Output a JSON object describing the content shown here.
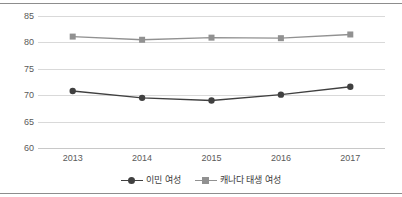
{
  "chart_data": {
    "type": "line",
    "title": "",
    "subtitle": "",
    "xlabel": "",
    "ylabel": "",
    "categories": [
      "2013",
      "2014",
      "2015",
      "2016",
      "2017"
    ],
    "ylim": [
      60,
      85
    ],
    "yticks": [
      60,
      65,
      70,
      75,
      80,
      85
    ],
    "ytick_labels": [
      "60",
      "65",
      "70",
      "75",
      "80",
      "85"
    ],
    "grid": true,
    "legend_position": "bottom",
    "series": [
      {
        "name": "이민 여성",
        "values": [
          70.8,
          69.5,
          69.0,
          70.1,
          71.6
        ],
        "color": "#404040",
        "marker": "circle"
      },
      {
        "name": "캐나다 태생 여성",
        "values": [
          81.1,
          80.5,
          80.9,
          80.8,
          81.5
        ],
        "color": "#919191",
        "marker": "square"
      }
    ]
  },
  "legend": {
    "items": [
      {
        "label": "이민 여성",
        "marker_name": "legend-marker-circle"
      },
      {
        "label": "캐나다 태생 여성",
        "marker_name": "legend-marker-square"
      }
    ]
  }
}
